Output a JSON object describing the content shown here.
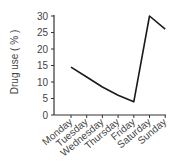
{
  "chart_data": {
    "type": "line",
    "title": "",
    "xlabel": "",
    "ylabel": "Drug use ( % )",
    "categories": [
      "Monday",
      "Tuesday",
      "Wednesday",
      "Thursday",
      "Friday",
      "Saturday",
      "Sunday"
    ],
    "series": [
      {
        "name": "Drug use",
        "values": [
          14.5,
          11.5,
          8.5,
          6,
          4,
          30,
          26
        ]
      }
    ],
    "ylim": [
      0,
      30
    ],
    "yticks": [
      0,
      5,
      10,
      15,
      20,
      25,
      30
    ],
    "grid": false,
    "legend": null
  },
  "colors": {
    "line": "#1a1a1a",
    "axis": "#333333",
    "text": "#444444"
  }
}
